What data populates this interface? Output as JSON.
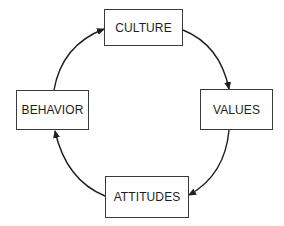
{
  "diagram": {
    "type": "cycle",
    "nodes": [
      {
        "id": "culture",
        "label": "CULTURE"
      },
      {
        "id": "values",
        "label": "VALUES"
      },
      {
        "id": "attitudes",
        "label": "ATTITUDES"
      },
      {
        "id": "behavior",
        "label": "BEHAVIOR"
      }
    ],
    "edges": [
      {
        "from": "culture",
        "to": "values"
      },
      {
        "from": "values",
        "to": "attitudes"
      },
      {
        "from": "attitudes",
        "to": "behavior"
      },
      {
        "from": "behavior",
        "to": "culture"
      }
    ],
    "colors": {
      "line": "#1e1e1e",
      "border": "#3a3a3a",
      "background": "#ffffff"
    }
  }
}
